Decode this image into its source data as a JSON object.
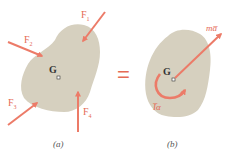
{
  "colors": {
    "body_fill": "#d6d0bf",
    "arrow": "#ec7b68",
    "label": "#e56a55",
    "background": "#ffffff"
  },
  "panel_a": {
    "caption": "(a)",
    "centroid_label": "G",
    "forces": [
      {
        "label": "F",
        "sub": "1"
      },
      {
        "label": "F",
        "sub": "2"
      },
      {
        "label": "F",
        "sub": "3"
      },
      {
        "label": "F",
        "sub": "4"
      }
    ]
  },
  "equals_sign": "=",
  "panel_b": {
    "caption": "(b)",
    "centroid_label": "G",
    "linear_label": "ma̅",
    "angular_label": "I̅α"
  }
}
